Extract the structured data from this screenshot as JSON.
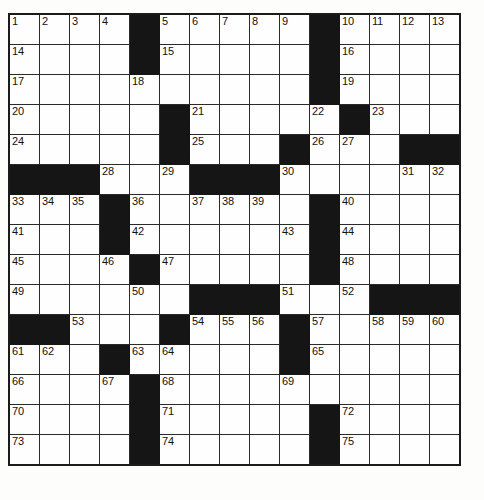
{
  "puzzle": {
    "kind": "crossword-grid",
    "rows": 15,
    "cols": 15,
    "cell_size_px": 31,
    "colors": {
      "block": "#151515",
      "open": "#fefefe",
      "grid_line": "#2a2a2a",
      "border": "#1b1b1b",
      "number_text": "#111111",
      "page_background": "#ffffff"
    },
    "highest_number": 75,
    "grid": [
      [
        {
          "num": "1",
          "block": false
        },
        {
          "num": "2",
          "block": false
        },
        {
          "num": "3",
          "block": false
        },
        {
          "num": "4",
          "block": false
        },
        {
          "num": "",
          "block": true
        },
        {
          "num": "5",
          "block": false
        },
        {
          "num": "6",
          "block": false
        },
        {
          "num": "7",
          "block": false
        },
        {
          "num": "8",
          "block": false
        },
        {
          "num": "9",
          "block": false
        },
        {
          "num": "",
          "block": true
        },
        {
          "num": "10",
          "block": false
        },
        {
          "num": "11",
          "block": false
        },
        {
          "num": "12",
          "block": false
        },
        {
          "num": "13",
          "block": false
        }
      ],
      [
        {
          "num": "14",
          "block": false
        },
        {
          "num": "",
          "block": false
        },
        {
          "num": "",
          "block": false
        },
        {
          "num": "",
          "block": false
        },
        {
          "num": "",
          "block": true
        },
        {
          "num": "15",
          "block": false
        },
        {
          "num": "",
          "block": false
        },
        {
          "num": "",
          "block": false
        },
        {
          "num": "",
          "block": false
        },
        {
          "num": "",
          "block": false
        },
        {
          "num": "",
          "block": true
        },
        {
          "num": "16",
          "block": false
        },
        {
          "num": "",
          "block": false
        },
        {
          "num": "",
          "block": false
        },
        {
          "num": "",
          "block": false
        }
      ],
      [
        {
          "num": "17",
          "block": false
        },
        {
          "num": "",
          "block": false
        },
        {
          "num": "",
          "block": false
        },
        {
          "num": "",
          "block": false
        },
        {
          "num": "18",
          "block": false
        },
        {
          "num": "",
          "block": false
        },
        {
          "num": "",
          "block": false
        },
        {
          "num": "",
          "block": false
        },
        {
          "num": "",
          "block": false
        },
        {
          "num": "",
          "block": false
        },
        {
          "num": "",
          "block": true
        },
        {
          "num": "19",
          "block": false
        },
        {
          "num": "",
          "block": false
        },
        {
          "num": "",
          "block": false
        },
        {
          "num": "",
          "block": false
        }
      ],
      [
        {
          "num": "20",
          "block": false
        },
        {
          "num": "",
          "block": false
        },
        {
          "num": "",
          "block": false
        },
        {
          "num": "",
          "block": false
        },
        {
          "num": "",
          "block": false
        },
        {
          "num": "",
          "block": true
        },
        {
          "num": "21",
          "block": false
        },
        {
          "num": "",
          "block": false
        },
        {
          "num": "",
          "block": false
        },
        {
          "num": "",
          "block": false
        },
        {
          "num": "22",
          "block": false
        },
        {
          "num": "",
          "block": true
        },
        {
          "num": "23",
          "block": false
        },
        {
          "num": "",
          "block": false
        },
        {
          "num": "",
          "block": false
        }
      ],
      [
        {
          "num": "24",
          "block": false
        },
        {
          "num": "",
          "block": false
        },
        {
          "num": "",
          "block": false
        },
        {
          "num": "",
          "block": false
        },
        {
          "num": "",
          "block": false
        },
        {
          "num": "",
          "block": true
        },
        {
          "num": "25",
          "block": false
        },
        {
          "num": "",
          "block": false
        },
        {
          "num": "",
          "block": false
        },
        {
          "num": "",
          "block": true
        },
        {
          "num": "26",
          "block": false
        },
        {
          "num": "27",
          "block": false
        },
        {
          "num": "",
          "block": false
        },
        {
          "num": "",
          "block": true
        },
        {
          "num": "",
          "block": true
        }
      ],
      [
        {
          "num": "",
          "block": true
        },
        {
          "num": "",
          "block": true
        },
        {
          "num": "",
          "block": true
        },
        {
          "num": "28",
          "block": false
        },
        {
          "num": "",
          "block": false
        },
        {
          "num": "29",
          "block": false
        },
        {
          "num": "",
          "block": true
        },
        {
          "num": "",
          "block": true
        },
        {
          "num": "",
          "block": true
        },
        {
          "num": "30",
          "block": false
        },
        {
          "num": "",
          "block": false
        },
        {
          "num": "",
          "block": false
        },
        {
          "num": "",
          "block": false
        },
        {
          "num": "31",
          "block": false
        },
        {
          "num": "32",
          "block": false
        }
      ],
      [
        {
          "num": "33",
          "block": false
        },
        {
          "num": "34",
          "block": false
        },
        {
          "num": "35",
          "block": false
        },
        {
          "num": "",
          "block": true
        },
        {
          "num": "36",
          "block": false
        },
        {
          "num": "",
          "block": false
        },
        {
          "num": "37",
          "block": false
        },
        {
          "num": "38",
          "block": false
        },
        {
          "num": "39",
          "block": false
        },
        {
          "num": "",
          "block": false
        },
        {
          "num": "",
          "block": true
        },
        {
          "num": "40",
          "block": false
        },
        {
          "num": "",
          "block": false
        },
        {
          "num": "",
          "block": false
        },
        {
          "num": "",
          "block": false
        }
      ],
      [
        {
          "num": "41",
          "block": false
        },
        {
          "num": "",
          "block": false
        },
        {
          "num": "",
          "block": false
        },
        {
          "num": "",
          "block": true
        },
        {
          "num": "42",
          "block": false
        },
        {
          "num": "",
          "block": false
        },
        {
          "num": "",
          "block": false
        },
        {
          "num": "",
          "block": false
        },
        {
          "num": "",
          "block": false
        },
        {
          "num": "43",
          "block": false
        },
        {
          "num": "",
          "block": true
        },
        {
          "num": "44",
          "block": false
        },
        {
          "num": "",
          "block": false
        },
        {
          "num": "",
          "block": false
        },
        {
          "num": "",
          "block": false
        }
      ],
      [
        {
          "num": "45",
          "block": false
        },
        {
          "num": "",
          "block": false
        },
        {
          "num": "",
          "block": false
        },
        {
          "num": "46",
          "block": false
        },
        {
          "num": "",
          "block": true
        },
        {
          "num": "47",
          "block": false
        },
        {
          "num": "",
          "block": false
        },
        {
          "num": "",
          "block": false
        },
        {
          "num": "",
          "block": false
        },
        {
          "num": "",
          "block": false
        },
        {
          "num": "",
          "block": true
        },
        {
          "num": "48",
          "block": false
        },
        {
          "num": "",
          "block": false
        },
        {
          "num": "",
          "block": false
        },
        {
          "num": "",
          "block": false
        }
      ],
      [
        {
          "num": "49",
          "block": false
        },
        {
          "num": "",
          "block": false
        },
        {
          "num": "",
          "block": false
        },
        {
          "num": "",
          "block": false
        },
        {
          "num": "50",
          "block": false
        },
        {
          "num": "",
          "block": false
        },
        {
          "num": "",
          "block": true
        },
        {
          "num": "",
          "block": true
        },
        {
          "num": "",
          "block": true
        },
        {
          "num": "51",
          "block": false
        },
        {
          "num": "",
          "block": false
        },
        {
          "num": "52",
          "block": false
        },
        {
          "num": "",
          "block": true
        },
        {
          "num": "",
          "block": true
        },
        {
          "num": "",
          "block": true
        }
      ],
      [
        {
          "num": "",
          "block": true
        },
        {
          "num": "",
          "block": true
        },
        {
          "num": "53",
          "block": false
        },
        {
          "num": "",
          "block": false
        },
        {
          "num": "",
          "block": false
        },
        {
          "num": "",
          "block": true
        },
        {
          "num": "54",
          "block": false
        },
        {
          "num": "55",
          "block": false
        },
        {
          "num": "56",
          "block": false
        },
        {
          "num": "",
          "block": true
        },
        {
          "num": "57",
          "block": false
        },
        {
          "num": "",
          "block": false
        },
        {
          "num": "58",
          "block": false
        },
        {
          "num": "59",
          "block": false
        },
        {
          "num": "60",
          "block": false
        }
      ],
      [
        {
          "num": "61",
          "block": false
        },
        {
          "num": "62",
          "block": false
        },
        {
          "num": "",
          "block": false
        },
        {
          "num": "",
          "block": true
        },
        {
          "num": "63",
          "block": false
        },
        {
          "num": "64",
          "block": false
        },
        {
          "num": "",
          "block": false
        },
        {
          "num": "",
          "block": false
        },
        {
          "num": "",
          "block": false
        },
        {
          "num": "",
          "block": true
        },
        {
          "num": "65",
          "block": false
        },
        {
          "num": "",
          "block": false
        },
        {
          "num": "",
          "block": false
        },
        {
          "num": "",
          "block": false
        },
        {
          "num": "",
          "block": false
        }
      ],
      [
        {
          "num": "66",
          "block": false
        },
        {
          "num": "",
          "block": false
        },
        {
          "num": "",
          "block": false
        },
        {
          "num": "67",
          "block": false
        },
        {
          "num": "",
          "block": true
        },
        {
          "num": "68",
          "block": false
        },
        {
          "num": "",
          "block": false
        },
        {
          "num": "",
          "block": false
        },
        {
          "num": "",
          "block": false
        },
        {
          "num": "69",
          "block": false
        },
        {
          "num": "",
          "block": false
        },
        {
          "num": "",
          "block": false
        },
        {
          "num": "",
          "block": false
        },
        {
          "num": "",
          "block": false
        },
        {
          "num": "",
          "block": false
        }
      ],
      [
        {
          "num": "70",
          "block": false
        },
        {
          "num": "",
          "block": false
        },
        {
          "num": "",
          "block": false
        },
        {
          "num": "",
          "block": false
        },
        {
          "num": "",
          "block": true
        },
        {
          "num": "71",
          "block": false
        },
        {
          "num": "",
          "block": false
        },
        {
          "num": "",
          "block": false
        },
        {
          "num": "",
          "block": false
        },
        {
          "num": "",
          "block": false
        },
        {
          "num": "",
          "block": true
        },
        {
          "num": "72",
          "block": false
        },
        {
          "num": "",
          "block": false
        },
        {
          "num": "",
          "block": false
        },
        {
          "num": "",
          "block": false
        }
      ],
      [
        {
          "num": "73",
          "block": false
        },
        {
          "num": "",
          "block": false
        },
        {
          "num": "",
          "block": false
        },
        {
          "num": "",
          "block": false
        },
        {
          "num": "",
          "block": true
        },
        {
          "num": "74",
          "block": false
        },
        {
          "num": "",
          "block": false
        },
        {
          "num": "",
          "block": false
        },
        {
          "num": "",
          "block": false
        },
        {
          "num": "",
          "block": false
        },
        {
          "num": "",
          "block": true
        },
        {
          "num": "75",
          "block": false
        },
        {
          "num": "",
          "block": false
        },
        {
          "num": "",
          "block": false
        },
        {
          "num": "",
          "block": false
        }
      ]
    ]
  }
}
